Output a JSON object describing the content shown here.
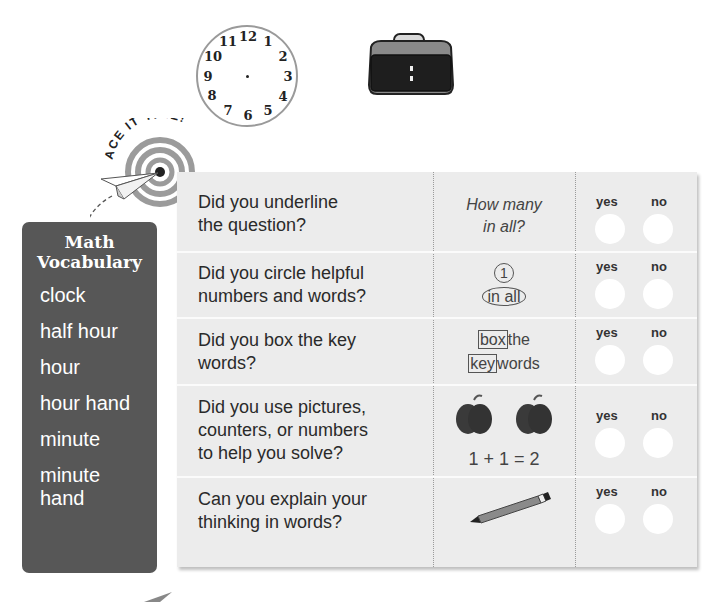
{
  "analog_clock": {
    "numerals": [
      "12",
      "1",
      "2",
      "3",
      "4",
      "5",
      "6",
      "7",
      "8",
      "9",
      "10",
      "11"
    ]
  },
  "digital_clock": {
    "display": ":"
  },
  "banner": {
    "text": "ACE IT TIME!"
  },
  "vocabulary": {
    "title_line1": "Math",
    "title_line2": "Vocabulary",
    "items": [
      "clock",
      "half hour",
      "hour",
      "hour hand",
      "minute",
      "minute hand"
    ]
  },
  "checklist": {
    "rows": [
      {
        "question_line1": "Did you underline",
        "question_line2": "the question?",
        "hint_line1": "How many",
        "hint_line2": "in all?",
        "yes_label": "yes",
        "no_label": "no"
      },
      {
        "question_line1": "Did you circle helpful",
        "question_line2": "numbers and words?",
        "hint_line1": "1",
        "hint_line2": "in all",
        "yes_label": "yes",
        "no_label": "no"
      },
      {
        "question_line1": "Did you box the key",
        "question_line2": "words?",
        "hint_box1": "box",
        "hint_rest1": "the",
        "hint_box2": "key",
        "hint_rest2": "words",
        "yes_label": "yes",
        "no_label": "no"
      },
      {
        "question_line1": "Did you use pictures,",
        "question_line2": "counters, or numbers",
        "question_line3": "to help you solve?",
        "hint_equation": "1 + 1 = 2",
        "yes_label": "yes",
        "no_label": "no"
      },
      {
        "question_line1": "Can you explain your",
        "question_line2": "thinking in words?",
        "yes_label": "yes",
        "no_label": "no"
      }
    ]
  },
  "colors": {
    "vocab_bg": "#575757",
    "table_bg": "#ececec",
    "apple": "#3a3a3a",
    "target_ring": "#9b9b9b"
  }
}
